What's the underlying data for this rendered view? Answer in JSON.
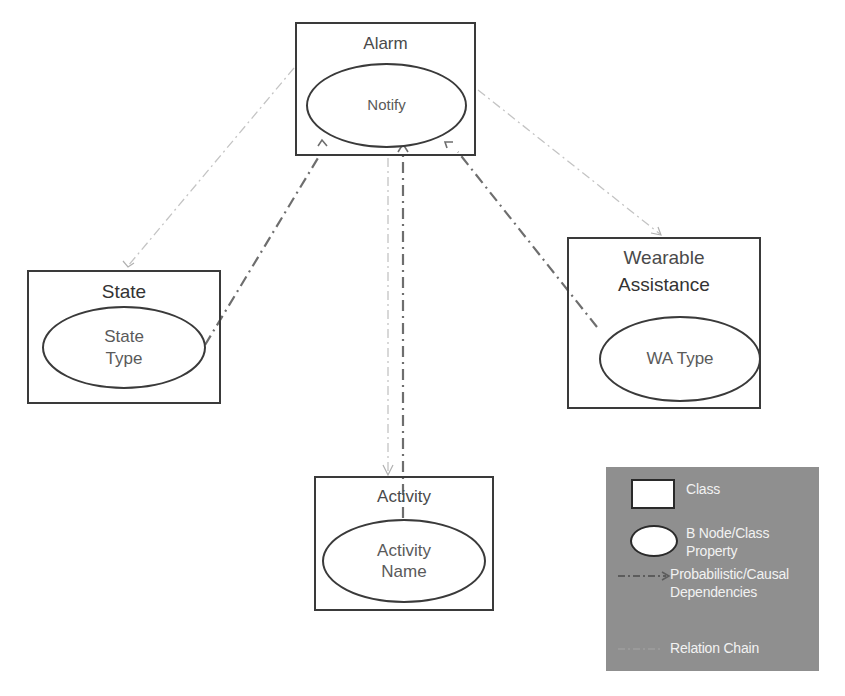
{
  "diagram": {
    "classes": {
      "alarm": {
        "title": "Alarm",
        "node": "Notify"
      },
      "state": {
        "title": "State",
        "node_line1": "State",
        "node_line2": "Type"
      },
      "wearable": {
        "title_line1": "Wearable",
        "title_line2": "Assistance",
        "node": "WA Type"
      },
      "activity": {
        "title": "Activity",
        "node_line1": "Activity",
        "node_line2": "Name"
      }
    },
    "edges": [
      {
        "from": "Alarm",
        "to": "State",
        "type": "relation-chain"
      },
      {
        "from": "State Type",
        "to": "Notify",
        "type": "probabilistic-causal"
      },
      {
        "from": "Alarm",
        "to": "Wearable Assistance",
        "type": "relation-chain"
      },
      {
        "from": "WA Type",
        "to": "Notify",
        "type": "probabilistic-causal"
      },
      {
        "from": "Alarm",
        "to": "Activity",
        "type": "relation-chain"
      },
      {
        "from": "Activity",
        "to": "Notify",
        "type": "probabilistic-causal"
      }
    ],
    "colors": {
      "box_border": "#3a3a3a",
      "relation_chain": "#c4c4c4",
      "causal_dependency": "#6e6e6e",
      "legend_bg": "#8f8f8f",
      "legend_text": "#f2f2f2"
    }
  },
  "legend": {
    "class_label": "Class",
    "node_label_line1": "B Node/Class",
    "node_label_line2": "Property",
    "dependency_label_line1": "Probabilistic/Causal",
    "dependency_label_line2": "Dependencies",
    "relation_label": "Relation Chain"
  }
}
